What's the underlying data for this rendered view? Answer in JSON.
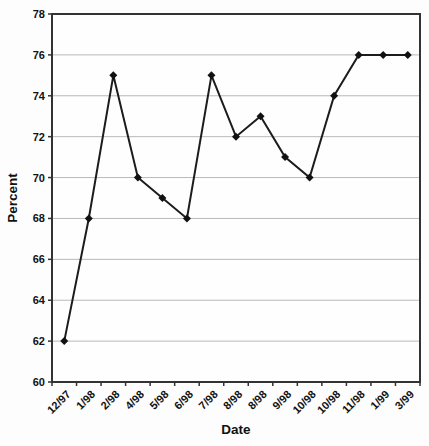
{
  "chart_data": {
    "type": "line",
    "title": "",
    "xlabel": "Date",
    "ylabel": "Percent",
    "categories": [
      "12/97",
      "1/98",
      "2/98",
      "4/98",
      "5/98",
      "6/98",
      "7/98",
      "8/98",
      "8/98",
      "9/98",
      "10/98",
      "10/98",
      "11/98",
      "1/99",
      "3/99"
    ],
    "series": [
      {
        "name": "Percent",
        "values": [
          62,
          68,
          75,
          70,
          69,
          68,
          75,
          72,
          73,
          71,
          70,
          74,
          76,
          76,
          76
        ]
      }
    ],
    "ylim": [
      60,
      78
    ],
    "ytick_step": 2,
    "grid": "horizontal-major",
    "legend": "none",
    "marker": "diamond",
    "colors": {
      "line": "#1c1c1c",
      "marker": "#111111",
      "gridline": "#b9b9b9",
      "plot_border": "#333333",
      "plot_fill": "#fefefe",
      "text": "#111111",
      "background": "#fdfdfd"
    }
  }
}
